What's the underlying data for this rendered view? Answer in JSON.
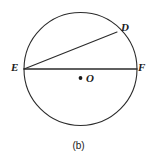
{
  "figure": {
    "caption": "(b)",
    "background_color": "#ffffff",
    "stroke_color": "#2b2b2b",
    "label_color": "#1a1a1a"
  },
  "labels": {
    "d": "D",
    "e": "E",
    "f": "F",
    "o": "O"
  },
  "chart_data": {
    "type": "diagram",
    "title": "(b)",
    "subtitle": "",
    "shape": "circle with diameter and chord",
    "canvas": {
      "width": 157,
      "height": 161
    },
    "circle": {
      "center_x": 80.5,
      "center_y": 69,
      "radius": 56.5,
      "stroke": "#2b2b2b",
      "stroke_width": 1.1,
      "fill": "none"
    },
    "points": [
      {
        "name": "E",
        "x": 24,
        "y": 69,
        "label_x": 14,
        "label_y": 67,
        "on_circle": true
      },
      {
        "name": "F",
        "x": 137,
        "y": 69,
        "label_x": 141,
        "label_y": 67,
        "on_circle": true
      },
      {
        "name": "D",
        "x": 117,
        "y": 32,
        "label_x": 124,
        "label_y": 27,
        "on_circle": true
      },
      {
        "name": "O",
        "x": 80.5,
        "y": 78,
        "label_x": 89,
        "label_y": 78,
        "on_circle": false,
        "marker": "dot"
      }
    ],
    "segments": [
      {
        "name": "EF",
        "from": "E",
        "to": "F",
        "kind": "diameter",
        "x1": 24,
        "y1": 69,
        "x2": 137,
        "y2": 69
      },
      {
        "name": "ED",
        "from": "E",
        "to": "D",
        "kind": "chord",
        "x1": 24,
        "y1": 69,
        "x2": 117,
        "y2": 32
      }
    ],
    "center_dot": {
      "x": 80.5,
      "y": 78,
      "radius": 1.9
    },
    "grid": false,
    "legend": null,
    "xlabel": "",
    "ylabel": ""
  }
}
